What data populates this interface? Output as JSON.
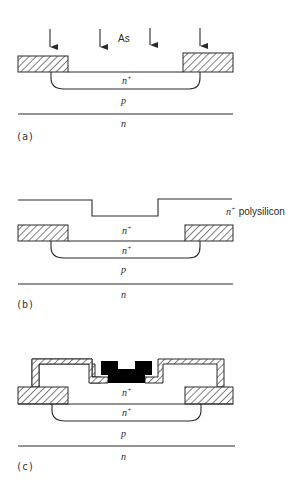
{
  "figure": {
    "panels": [
      {
        "id": "a",
        "caption": "(a)",
        "implant_species": "As",
        "arrow_count": 4,
        "labels": {
          "junction_region": "n",
          "junction_region_sup": "+",
          "well": "p",
          "substrate": "n"
        }
      },
      {
        "id": "b",
        "caption": "(b)",
        "labels": {
          "poly_layer": "n",
          "poly_layer_sup": "+",
          "poly_layer_text": "polysilicon",
          "poly_fill": "n",
          "poly_fill_sup": "+",
          "junction_region": "n",
          "junction_region_sup": "+",
          "well": "p",
          "substrate": "n"
        }
      },
      {
        "id": "c",
        "caption": "(c)",
        "labels": {
          "poly_fill": "n",
          "poly_fill_sup": "+",
          "junction_region": "n",
          "junction_region_sup": "+",
          "well": "p",
          "substrate": "n"
        }
      }
    ],
    "colors": {
      "ink": "#2a2a2a",
      "metal_contact": "#000000",
      "background": "#ffffff"
    }
  }
}
